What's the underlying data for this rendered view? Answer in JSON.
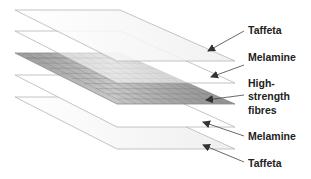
{
  "diagram": {
    "type": "exploded-layer-stack",
    "layers": [
      {
        "name": "Taffeta",
        "position": "top",
        "fill": "#f4f4f4"
      },
      {
        "name": "Melamine",
        "position": "upper-middle",
        "fill": "#ffffff"
      },
      {
        "name": "High-strength fibres",
        "position": "middle",
        "fill": "#9a9a9a",
        "pattern": "grid"
      },
      {
        "name": "Melamine",
        "position": "lower-middle",
        "fill": "#ffffff"
      },
      {
        "name": "Taffeta",
        "position": "bottom",
        "fill": "#f4f4f4"
      }
    ],
    "labels": {
      "l1": "Taffeta",
      "l2": "Melamine",
      "l3_line1": "High-",
      "l3_line2": "strength",
      "l3_line3": "fibres",
      "l4": "Melamine",
      "l5": "Taffeta"
    },
    "colors": {
      "edge": "#b5b5b5",
      "arrow": "#444444",
      "grid_dark": "#8f8f8f",
      "grid_light": "#d8d8d8"
    }
  }
}
